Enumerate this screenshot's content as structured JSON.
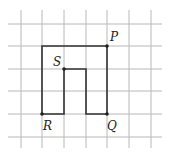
{
  "diagram": {
    "type": "grid-figure",
    "grid": {
      "x_lines": [
        21,
        42,
        64,
        86,
        107,
        129,
        151
      ],
      "y_lines": [
        24,
        46,
        69,
        91,
        114,
        137
      ],
      "x_extent": [
        8,
        162
      ],
      "y_extent": [
        10,
        148
      ],
      "color": "#b8b8b8"
    },
    "shape": {
      "stroke": "#333333",
      "points": [
        [
          107,
          46
        ],
        [
          42,
          46
        ],
        [
          42,
          114
        ],
        [
          64,
          114
        ],
        [
          64,
          69
        ],
        [
          86,
          69
        ],
        [
          86,
          114
        ],
        [
          107,
          114
        ]
      ]
    },
    "points": [
      {
        "label": "P",
        "x": 107,
        "y": 46,
        "lx": 110,
        "ly": 41
      },
      {
        "label": "Q",
        "x": 107,
        "y": 114,
        "lx": 107,
        "ly": 130
      },
      {
        "label": "R",
        "x": 42,
        "y": 114,
        "lx": 43,
        "ly": 130
      },
      {
        "label": "S",
        "x": 64,
        "y": 69,
        "lx": 53,
        "ly": 66
      }
    ]
  }
}
